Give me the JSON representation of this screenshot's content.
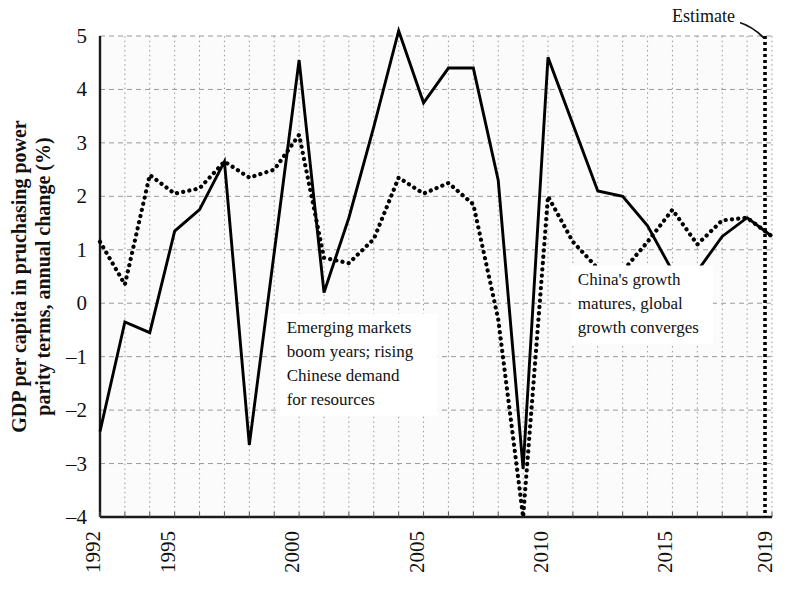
{
  "chart_data": {
    "type": "line",
    "title": "",
    "xlabel": "",
    "ylabel": "GDP per capita in pruchasing power parity terms, annual change (%)",
    "xlim": [
      1992,
      2019
    ],
    "ylim": [
      -4,
      5
    ],
    "grid": true,
    "legend_position": "none",
    "x": [
      1992,
      1993,
      1994,
      1995,
      1996,
      1997,
      1998,
      1999,
      2000,
      2001,
      2002,
      2003,
      2004,
      2005,
      2006,
      2007,
      2008,
      2009,
      2010,
      2011,
      2012,
      2013,
      2014,
      2015,
      2016,
      2017,
      2018,
      2019
    ],
    "y_ticks": [
      -4,
      -3,
      -2,
      -1,
      0,
      1,
      2,
      3,
      4,
      5
    ],
    "y_tick_labels": [
      "-4",
      "-3",
      "-2",
      "-1",
      "0",
      "1",
      "2",
      "3",
      "4",
      "5"
    ],
    "x_ticks": [
      1992,
      1995,
      2000,
      2005,
      2010,
      2015,
      2019
    ],
    "x_tick_labels": [
      "1992",
      "1995",
      "2000",
      "2005",
      "2010",
      "2015",
      "2019"
    ],
    "series": [
      {
        "name": "solid-series",
        "style": "solid",
        "color": "#000000",
        "values": [
          -2.4,
          -0.35,
          -0.55,
          1.35,
          1.75,
          2.65,
          -2.65,
          0.95,
          4.55,
          0.2,
          1.6,
          3.3,
          5.1,
          3.75,
          4.4,
          4.4,
          2.3,
          -3.1,
          4.6,
          3.35,
          2.1,
          2.0,
          1.45,
          0.6,
          0.6,
          1.25,
          1.6,
          1.25
        ]
      },
      {
        "name": "dotted-series",
        "style": "dotted",
        "color": "#000000",
        "values": [
          1.15,
          0.35,
          2.4,
          2.05,
          2.15,
          2.65,
          2.35,
          2.5,
          3.15,
          0.85,
          0.75,
          1.2,
          2.35,
          2.05,
          2.25,
          1.85,
          -0.3,
          -4.0,
          2.0,
          1.15,
          0.65,
          0.6,
          1.15,
          1.75,
          1.1,
          1.55,
          1.6,
          1.25
        ]
      }
    ],
    "annotations": [
      {
        "name": "emerging-markets-note",
        "lines": [
          "Emerging markets",
          "boom years; rising",
          "Chinese demand",
          "for resources"
        ],
        "x": 1999.5,
        "y": -0.55
      },
      {
        "name": "china-growth-note",
        "lines": [
          "China's growth",
          "matures, global",
          "growth converges"
        ],
        "x": 2011.2,
        "y": 0.35
      }
    ],
    "estimate_marker": {
      "label": "Estimate",
      "x": 2019,
      "line_style": "dotted-vertical"
    }
  },
  "colors": {
    "axis": "#1a1a1a",
    "gridline": "#9a9a9a",
    "plot_background": "#fbfbfb",
    "series": "#000000",
    "text": "#111111"
  }
}
